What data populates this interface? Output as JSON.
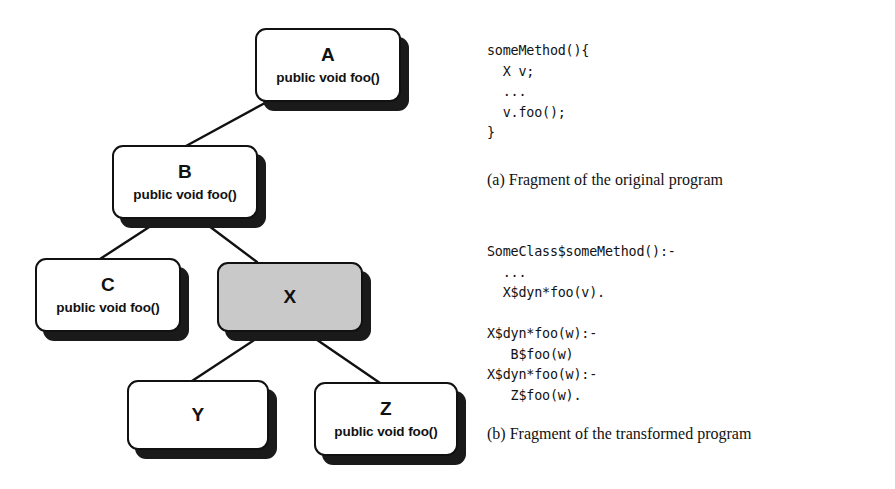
{
  "figure": {
    "diagram": {
      "title": "class-hierarchy",
      "highlight_color": "#c9c9c9",
      "shadow_color": "#1a1a1a",
      "nodes": [
        {
          "id": "A",
          "name": "A",
          "member": "public void foo()",
          "highlighted": false
        },
        {
          "id": "B",
          "name": "B",
          "member": "public void foo()",
          "highlighted": false
        },
        {
          "id": "C",
          "name": "C",
          "member": "public void foo()",
          "highlighted": false
        },
        {
          "id": "X",
          "name": "X",
          "member": "",
          "highlighted": true
        },
        {
          "id": "Y",
          "name": "Y",
          "member": "",
          "highlighted": false
        },
        {
          "id": "Z",
          "name": "Z",
          "member": "public void foo()",
          "highlighted": false
        }
      ],
      "edges": [
        {
          "from": "A",
          "to": "B"
        },
        {
          "from": "B",
          "to": "C"
        },
        {
          "from": "B",
          "to": "X"
        },
        {
          "from": "X",
          "to": "Y"
        },
        {
          "from": "X",
          "to": "Z"
        }
      ]
    },
    "code_original": "someMethod(){\n  X v;\n  ...\n  v.foo();\n}",
    "caption_a": "(a) Fragment of the original program",
    "code_transformed": "SomeClass$someMethod():-\n  ...\n  X$dyn*foo(v).\n\nX$dyn*foo(w):-\n   B$foo(w)\nX$dyn*foo(w):-\n   Z$foo(w).",
    "caption_b": "(b) Fragment of the transformed program"
  }
}
